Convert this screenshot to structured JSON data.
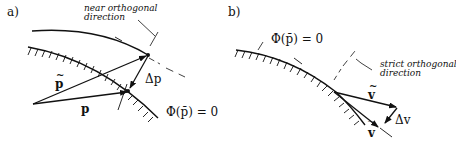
{
  "panel_a": {
    "label": "a)",
    "annotation_line1": "near orthogonal",
    "annotation_line2": "direction",
    "vec_tilde_p": "p",
    "vec_bar_p": "p",
    "delta_label": "Δp",
    "constraint_label": "Φ(p̄) = 0"
  },
  "panel_b": {
    "label": "b)",
    "constraint_label": "Φ(p̄) = 0",
    "annotation_line1": "strict orthogonal",
    "annotation_line2": "direction",
    "vec_tilde_v": "v",
    "vec_bar_v": "v",
    "delta_label": "Δv"
  },
  "colors": {
    "ink": "#111111",
    "background": "#ffffff"
  }
}
